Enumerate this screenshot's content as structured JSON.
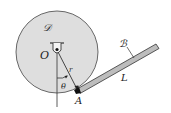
{
  "diagram": {
    "type": "mechanics-figure",
    "labels": {
      "disc": "𝒟",
      "bar": "ℬ",
      "pivot": "O",
      "radius": "r",
      "angle": "θ",
      "contact_point": "A",
      "length": "L"
    },
    "colors": {
      "disc_fill": "#dedede",
      "bar_fill": "#bdbdbd",
      "stroke": "#333333",
      "background": "#ffffff"
    },
    "geometry": {
      "disc_center": [
        57,
        52
      ],
      "disc_radius": 41,
      "pivot": [
        57,
        50
      ],
      "point_A": [
        78,
        91
      ],
      "bar_end": [
        158,
        46
      ]
    }
  }
}
